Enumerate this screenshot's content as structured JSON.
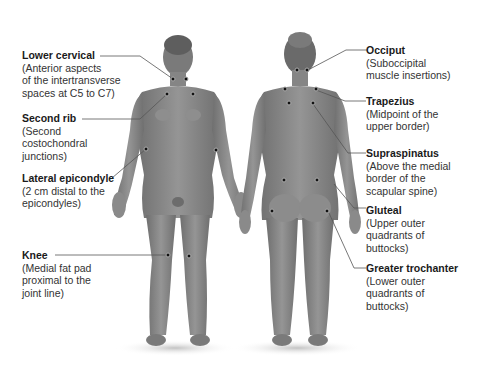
{
  "figure": {
    "views": [
      "anterior",
      "posterior"
    ],
    "colors": {
      "background": "#ffffff",
      "skin": "#8a8a8a",
      "skin_shadow": "#6e6e6e",
      "leader_line": "#555555",
      "point": "#111111",
      "text": "#1a1a1a"
    }
  },
  "left_labels": [
    {
      "title": "Lower cervical",
      "desc": [
        "(Anterior aspects",
        "of the intertransverse",
        "spaces at C5 to C7)"
      ]
    },
    {
      "title": "Second rib",
      "desc": [
        "(Second",
        "costochondral",
        "junctions)"
      ]
    },
    {
      "title": "Lateral epicondyle",
      "desc": [
        "(2 cm distal to the",
        "epicondyles)"
      ]
    },
    {
      "title": "Knee",
      "desc": [
        "(Medial fat pad",
        "proximal to the",
        "joint line)"
      ]
    }
  ],
  "right_labels": [
    {
      "title": "Occiput",
      "desc": [
        "(Suboccipital",
        "muscle insertions)"
      ]
    },
    {
      "title": "Trapezius",
      "desc": [
        "(Midpoint of the",
        "upper border)"
      ]
    },
    {
      "title": "Supraspinatus",
      "desc": [
        "(Above the medial",
        "border of the",
        "scapular spine)"
      ]
    },
    {
      "title": "Gluteal",
      "desc": [
        "(Upper outer",
        "quadrants of",
        "buttocks)"
      ]
    },
    {
      "title": "Greater trochanter",
      "desc": [
        "(Lower outer",
        "quadrants of",
        "buttocks)"
      ]
    }
  ]
}
